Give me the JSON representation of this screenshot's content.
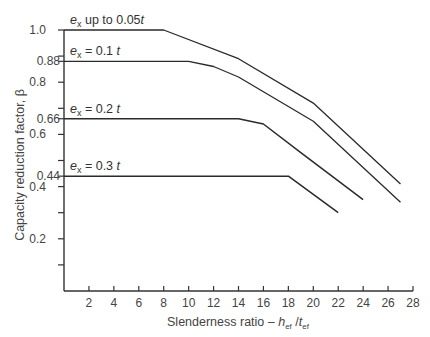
{
  "chart_data": {
    "type": "line",
    "title": "",
    "xlabel": "Slenderness ratio – h_ef / t_ef",
    "ylabel": "Capacity reduction factor, β",
    "xlim": [
      0,
      28
    ],
    "ylim": [
      0,
      1.0
    ],
    "xticks": [
      2,
      4,
      6,
      8,
      10,
      12,
      14,
      16,
      18,
      20,
      22,
      24,
      26,
      28
    ],
    "yticks_labeled": [
      1.0,
      0.88,
      0.8,
      0.66,
      0.6,
      0.44,
      0.4,
      0.2
    ],
    "yticks_unlabeled": [
      0.9,
      0.7,
      0.5,
      0.3,
      0.1
    ],
    "grid": false,
    "legend": "inline labels above each curve",
    "series": [
      {
        "name": "e_x up to 0.05t",
        "x": [
          0,
          8,
          14,
          20,
          27
        ],
        "y": [
          1.0,
          1.0,
          0.89,
          0.72,
          0.41
        ]
      },
      {
        "name": "e_x = 0.1t",
        "x": [
          0,
          10,
          12,
          14,
          20,
          27
        ],
        "y": [
          0.88,
          0.88,
          0.86,
          0.82,
          0.65,
          0.34
        ]
      },
      {
        "name": "e_x = 0.2t",
        "x": [
          0,
          14,
          16,
          19,
          24
        ],
        "y": [
          0.66,
          0.66,
          0.64,
          0.53,
          0.35
        ]
      },
      {
        "name": "e_x = 0.3t",
        "x": [
          0,
          18,
          22
        ],
        "y": [
          0.44,
          0.44,
          0.3
        ]
      }
    ]
  },
  "labels": {
    "series": [
      {
        "main": "e",
        "sub": "x",
        "rest": " up to 0.05",
        "tail": "t"
      },
      {
        "main": "e",
        "sub": "x",
        "rest": " = 0.1 ",
        "tail": "t"
      },
      {
        "main": "e",
        "sub": "x",
        "rest": " = 0.2 ",
        "tail": "t"
      },
      {
        "main": "e",
        "sub": "x",
        "rest": " = 0.3 ",
        "tail": "t"
      }
    ],
    "ylabel": "Capacity reduction factor, β",
    "xlabel_prefix": "Slenderness ratio – ",
    "xlabel_h": "h",
    "xlabel_sub1": "ef",
    "xlabel_slash": " /",
    "xlabel_t": "t",
    "xlabel_sub2": "ef"
  }
}
